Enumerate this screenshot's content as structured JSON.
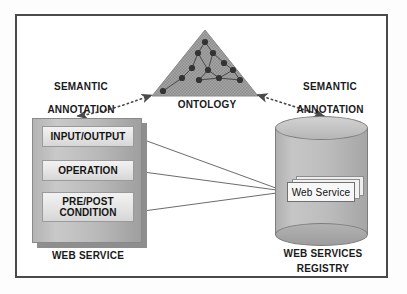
{
  "figure": {
    "frame_color": "#4a4a4a",
    "background": "#ffffff"
  },
  "ontology": {
    "label": "ONTOLOGY",
    "shape": "triangle",
    "fill_color": "#9a9a9a",
    "node_color": "#3a3a3a",
    "nodes": [
      {
        "x": 205,
        "y": 42
      },
      {
        "x": 198,
        "y": 53
      },
      {
        "x": 213,
        "y": 53
      },
      {
        "x": 192,
        "y": 68
      },
      {
        "x": 208,
        "y": 70
      },
      {
        "x": 224,
        "y": 63
      },
      {
        "x": 233,
        "y": 70
      },
      {
        "x": 182,
        "y": 78
      },
      {
        "x": 199,
        "y": 80
      },
      {
        "x": 219,
        "y": 78
      },
      {
        "x": 240,
        "y": 80
      },
      {
        "x": 163,
        "y": 91
      }
    ],
    "edges": [
      [
        0,
        1
      ],
      [
        0,
        2
      ],
      [
        1,
        3
      ],
      [
        1,
        4
      ],
      [
        2,
        4
      ],
      [
        2,
        5
      ],
      [
        5,
        6
      ],
      [
        4,
        8
      ],
      [
        3,
        7
      ],
      [
        7,
        11
      ],
      [
        8,
        9
      ],
      [
        9,
        6
      ],
      [
        9,
        10
      ],
      [
        4,
        9
      ],
      [
        6,
        10
      ]
    ]
  },
  "annotations": {
    "left": {
      "line1": "SEMANTIC",
      "line2": "ANNOTATION",
      "arrow": "dotted-double-arrow"
    },
    "right": {
      "line1": "SEMANTIC",
      "line2": "ANNOTATION",
      "arrow": "dotted-double-arrow"
    }
  },
  "web_service": {
    "caption": "WEB SERVICE",
    "components": [
      {
        "id": "input-output",
        "label": "INPUT/OUTPUT"
      },
      {
        "id": "operation",
        "label": "OPERATION"
      },
      {
        "id": "pre-post-condition",
        "label": "PRE/POST\nCONDITION"
      }
    ],
    "box_color": "#b9b9b9",
    "bar_color": "#e6e6e6"
  },
  "registry": {
    "caption_line1": "WEB SERVICES",
    "caption_line2": "REGISTRY",
    "cylinder_color": "#bdbdbd",
    "entry": {
      "label": "Web Service",
      "stack_count": 3
    }
  },
  "connectors": {
    "count": 3,
    "style": "solid-thin-arrow",
    "color": "#555555",
    "description": "Three lines from the Web Service component bars converge on the Web Service entry in the registry"
  }
}
